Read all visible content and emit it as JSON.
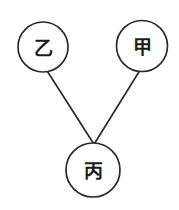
{
  "diagram": {
    "background_color": "#ffffff",
    "stroke_color": "#2b2b2b",
    "label_color": "#1c1c1c",
    "stroke_width": 1.7,
    "nodes": [
      {
        "id": "yi",
        "label": "乙",
        "cx": 43,
        "cy": 47,
        "r": 25,
        "position": "top-left"
      },
      {
        "id": "jia",
        "label": "甲",
        "cx": 142,
        "cy": 46,
        "r": 25.5,
        "position": "top-right"
      },
      {
        "id": "bing",
        "label": "丙",
        "cx": 93,
        "cy": 170,
        "r": 27,
        "position": "bottom-center"
      }
    ],
    "edges": [
      {
        "id": "edge-yi-bing",
        "from": "yi",
        "to": "bing",
        "x1": 47.5,
        "y1": 71.5,
        "x2": 93.5,
        "y2": 143.5
      },
      {
        "id": "edge-jia-bing",
        "from": "jia",
        "to": "bing",
        "x1": 139.5,
        "y1": 71,
        "x2": 94.5,
        "y2": 143.5
      }
    ]
  }
}
